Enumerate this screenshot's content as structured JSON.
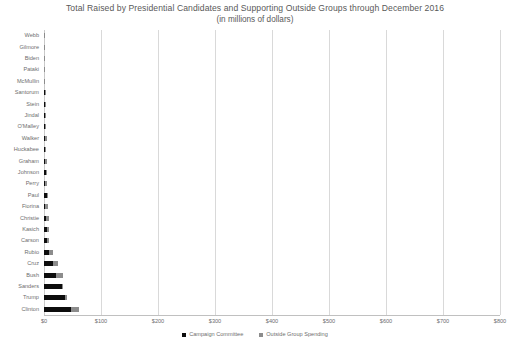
{
  "chart_data": {
    "type": "bar",
    "orientation": "horizontal",
    "stacked": true,
    "title": "Total Raised by Presidential Candidates and Supporting Outside Groups through December 2016",
    "subtitle": "(in millions of dollars)",
    "xlabel": "",
    "ylabel": "",
    "xlim": [
      0,
      800
    ],
    "xticks": [
      0,
      100,
      200,
      300,
      400,
      500,
      600,
      700,
      800
    ],
    "xticklabels": [
      "$0",
      "$100",
      "$200",
      "$300",
      "$400",
      "$500",
      "$600",
      "$700",
      "$800"
    ],
    "grid": true,
    "legend_position": "bottom",
    "categories": [
      "Webb",
      "Gilmore",
      "Biden",
      "Pataki",
      "McMullin",
      "Santorum",
      "Stein",
      "Jindal",
      "O'Malley",
      "Walker",
      "Huckabee",
      "Graham",
      "Johnson",
      "Perry",
      "Paul",
      "Fiorina",
      "Christie",
      "Kasich",
      "Carson",
      "Rubio",
      "Cruz",
      "Bush",
      "Sanders",
      "Trump",
      "Clinton"
    ],
    "series": [
      {
        "name": "Campaign Committee",
        "color": "#0d0d0d",
        "values": [
          0.7,
          0.4,
          0.3,
          0.6,
          0.8,
          1.5,
          0.9,
          1.4,
          1.6,
          2.2,
          2.6,
          1.5,
          3.4,
          1.9,
          4.6,
          2.0,
          3.6,
          4.5,
          5.4,
          8.1,
          16.4,
          20.2,
          31.5,
          36.0,
          46.9
        ]
      },
      {
        "name": "Outside Group Spending",
        "color": "#8c8c8c",
        "values": [
          0.2,
          0.3,
          0.2,
          0.4,
          0.2,
          0.8,
          0.1,
          1.0,
          1.2,
          2.8,
          1.4,
          3.1,
          0.6,
          3.4,
          1.5,
          4.2,
          4.9,
          4.2,
          2.7,
          7.6,
          7.3,
          12.3,
          0.4,
          4.1,
          14.6
        ]
      }
    ]
  },
  "legend": {
    "items": [
      {
        "label": "Campaign Committee",
        "color": "#0d0d0d"
      },
      {
        "label": "Outside Group Spending",
        "color": "#8c8c8c"
      }
    ]
  }
}
